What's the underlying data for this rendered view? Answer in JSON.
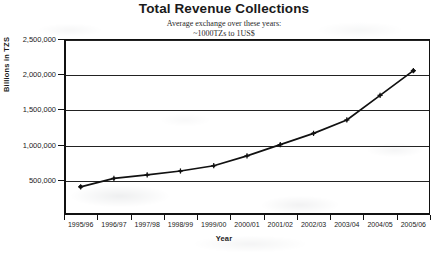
{
  "chart_data": {
    "type": "line",
    "title": "Total Revenue Collections",
    "subtitle_line1": "Average exchange over these years:",
    "subtitle_line2": "~1000TZs to 1US$",
    "xlabel": "Year",
    "ylabel": "Billions in TZS",
    "categories": [
      "1995/96",
      "1996/97",
      "1997/98",
      "1998/99",
      "1999/00",
      "2000/01",
      "2001/02",
      "2002/03",
      "2003/04",
      "2004/05",
      "2005/06"
    ],
    "series": [
      {
        "name": "Total Revenue Collections",
        "values": [
          400000,
          520000,
          570000,
          625000,
          700000,
          840000,
          1000000,
          1160000,
          1350000,
          1700000,
          2050000
        ]
      }
    ],
    "ylim": [
      0,
      2500000
    ],
    "ytick_values": [
      500000,
      1000000,
      1500000,
      2000000,
      2500000
    ],
    "ytick_labels": [
      "500,000",
      "1,000,000",
      "1,500,000",
      "2,000,000",
      "2,500,000"
    ],
    "grid": true,
    "grid_axis": "y",
    "legend": false,
    "marker": "plus-dot",
    "line_color": "#111111",
    "background_color": "#ffffff"
  }
}
